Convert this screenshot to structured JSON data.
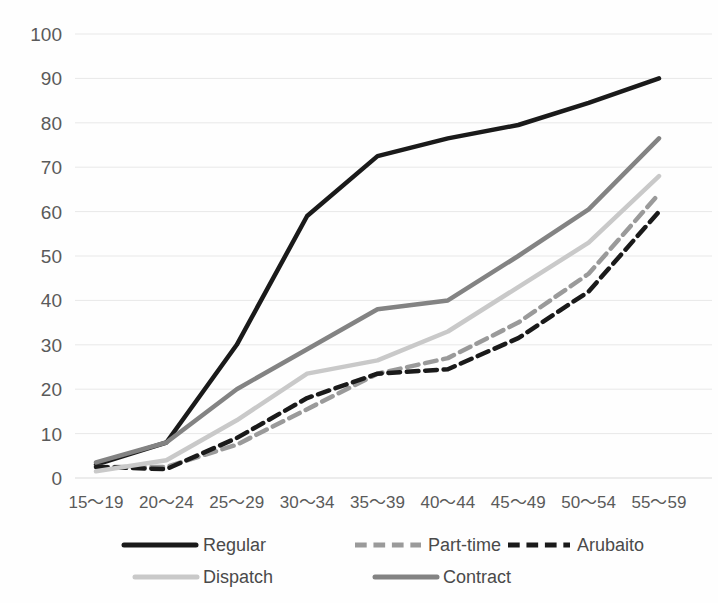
{
  "chart_data": {
    "type": "line",
    "title": "",
    "subtitle": "",
    "xlabel": "",
    "ylabel": "",
    "ylim": [
      0,
      100
    ],
    "ytick_step": 10,
    "grid": true,
    "legend_position": "bottom",
    "categories": [
      "15～19",
      "20～24",
      "25～29",
      "30～34",
      "35～39",
      "40～44",
      "45～49",
      "50～54",
      "55～59"
    ],
    "ytick_labels": [
      "0",
      "10",
      "20",
      "30",
      "40",
      "50",
      "60",
      "70",
      "80",
      "90",
      "100"
    ],
    "series": [
      {
        "name": "Regular",
        "color": "#1a1a1a",
        "style": "solid",
        "width": 4.5,
        "values": [
          3.0,
          8.0,
          30.0,
          59.0,
          72.5,
          76.5,
          79.5,
          84.5,
          90.0
        ]
      },
      {
        "name": "Part-time",
        "color": "#9a9a9a",
        "style": "dashed",
        "width": 4.5,
        "values": [
          2.5,
          2.5,
          7.5,
          15.5,
          23.5,
          27.0,
          35.0,
          46.0,
          64.0
        ]
      },
      {
        "name": "Arubaito",
        "color": "#1a1a1a",
        "style": "dashed",
        "width": 4.5,
        "values": [
          2.5,
          2.0,
          9.0,
          18.0,
          23.5,
          24.5,
          31.5,
          42.0,
          60.0
        ]
      },
      {
        "name": "Dispatch",
        "color": "#c9c9c9",
        "style": "solid",
        "width": 4.5,
        "values": [
          1.5,
          4.0,
          13.0,
          23.5,
          26.5,
          33.0,
          43.0,
          53.0,
          68.0
        ]
      },
      {
        "name": "Contract",
        "color": "#838383",
        "style": "solid",
        "width": 4.5,
        "values": [
          3.5,
          8.0,
          20.0,
          29.0,
          38.0,
          40.0,
          50.0,
          60.5,
          76.5
        ]
      }
    ]
  },
  "legend": {
    "items": [
      {
        "label": "Regular"
      },
      {
        "label": "Part-time"
      },
      {
        "label": "Arubaito"
      },
      {
        "label": "Dispatch"
      },
      {
        "label": "Contract"
      }
    ]
  }
}
